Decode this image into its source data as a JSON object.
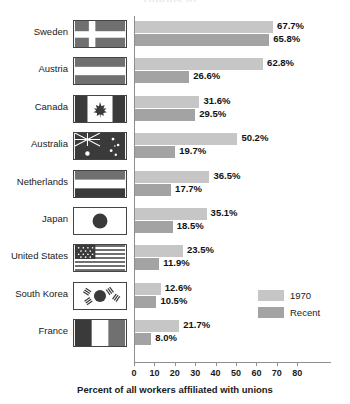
{
  "chart_data": {
    "type": "bar",
    "orientation": "horizontal",
    "title": "Unions in...",
    "xlabel": "Percent of all workers affiliated with unions",
    "ylabel": "",
    "xlim": [
      0,
      88
    ],
    "xticks": [
      0,
      10,
      20,
      30,
      40,
      50,
      60,
      70,
      80
    ],
    "xtick_labels": [
      "0",
      "10",
      "20",
      "30",
      "40",
      "50",
      "60",
      "70",
      "80"
    ],
    "grid": false,
    "legend_position": "inside-lower-right",
    "categories": [
      "Sweden",
      "Austria",
      "Canada",
      "Australia",
      "Netherlands",
      "Japan",
      "United States",
      "South Korea",
      "France"
    ],
    "series": [
      {
        "name": "1970",
        "color": "#c6c6c6",
        "values": [
          67.7,
          62.8,
          31.6,
          50.2,
          36.5,
          35.1,
          23.5,
          12.6,
          21.7
        ],
        "labels": [
          "67.7%",
          "62.8%",
          "31.6%",
          "50.2%",
          "36.5%",
          "35.1%",
          "23.5%",
          "12.6%",
          "21.7%"
        ]
      },
      {
        "name": "Recent",
        "color": "#a3a3a3",
        "values": [
          65.8,
          26.6,
          29.5,
          19.7,
          17.7,
          18.5,
          11.9,
          10.5,
          8.0
        ],
        "labels": [
          "65.8%",
          "26.6%",
          "29.5%",
          "19.7%",
          "17.7%",
          "18.5%",
          "11.9%",
          "10.5%",
          "8.0%"
        ]
      }
    ]
  },
  "legend": {
    "items": [
      {
        "label": "1970",
        "color": "#c6c6c6"
      },
      {
        "label": "Recent",
        "color": "#a3a3a3"
      }
    ]
  },
  "flags": {
    "Sweden": "sweden-flag-icon",
    "Austria": "austria-flag-icon",
    "Canada": "canada-flag-icon",
    "Australia": "australia-flag-icon",
    "Netherlands": "netherlands-flag-icon",
    "Japan": "japan-flag-icon",
    "United States": "united-states-flag-icon",
    "South Korea": "south-korea-flag-icon",
    "France": "france-flag-icon"
  }
}
